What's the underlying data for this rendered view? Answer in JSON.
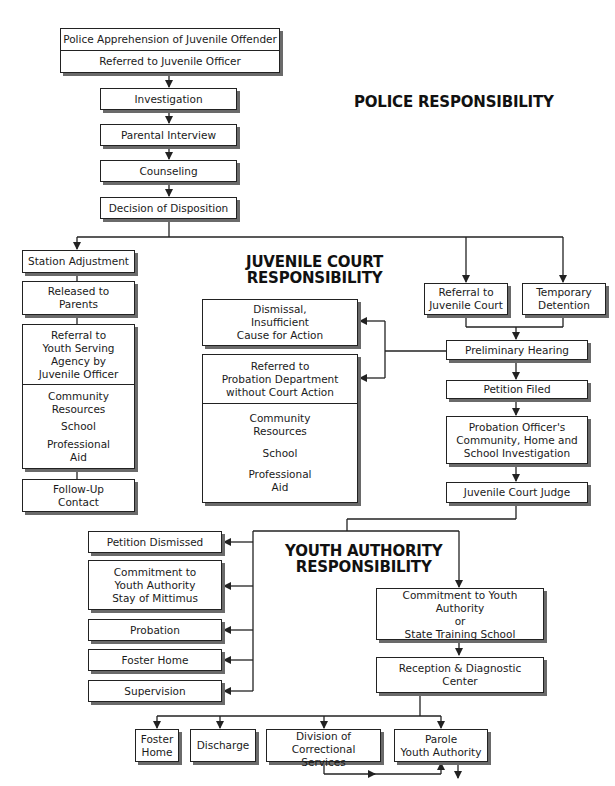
{
  "sections": {
    "police": "POLICE RESPONSIBILITY",
    "juvenile_court": "JUVENILE COURT\nRESPONSIBILITY",
    "youth_authority": "YOUTH AUTHORITY\nRESPONSIBILITY"
  },
  "police_flow": {
    "apprehension": "Police Apprehension of Juvenile Offender",
    "referred_officer": "Referred to Juvenile Officer",
    "investigation": "Investigation",
    "parental_interview": "Parental Interview",
    "counseling": "Counseling",
    "decision": "Decision of Disposition"
  },
  "station_branch": {
    "station_adjustment": "Station Adjustment",
    "released": "Released to\nParents",
    "referral_agency": "Referral to\nYouth Serving\nAgency by\nJuvenile Officer",
    "resources": [
      "Community\nResources",
      "School",
      "Professional\nAid"
    ],
    "follow_up": "Follow-Up\nContact"
  },
  "court_branch": {
    "dismissal": "Dismissal,\nInsufficient\nCause for Action",
    "referred_probation": "Referred to\nProbation Department\nwithout Court Action",
    "resources": [
      "Community\nResources",
      "School",
      "Professional\nAid"
    ],
    "referral_court": "Referral to\nJuvenile Court",
    "temporary_detention": "Temporary\nDetention",
    "preliminary_hearing": "Preliminary Hearing",
    "petition_filed": "Petition Filed",
    "probation_investigation": "Probation Officer's\nCommunity, Home and\nSchool Investigation",
    "judge": "Juvenile Court Judge"
  },
  "judge_outcomes": {
    "petition_dismissed": "Petition Dismissed",
    "commitment_stay": "Commitment to\nYouth Authority\nStay of Mittimus",
    "probation": "Probation",
    "foster_home": "Foster Home",
    "supervision": "Supervision"
  },
  "youth_authority_flow": {
    "commitment": "Commitment to Youth Authority\nor\nState Training School",
    "reception": "Reception & Diagnostic\nCenter",
    "foster_home": "Foster\nHome",
    "discharge": "Discharge",
    "correctional": "Division of\nCorrectional Services",
    "parole": "Parole\nYouth Authority"
  },
  "colors": {
    "line": "#222222",
    "shadow": "#6a6a6a",
    "background": "#ffffff"
  }
}
